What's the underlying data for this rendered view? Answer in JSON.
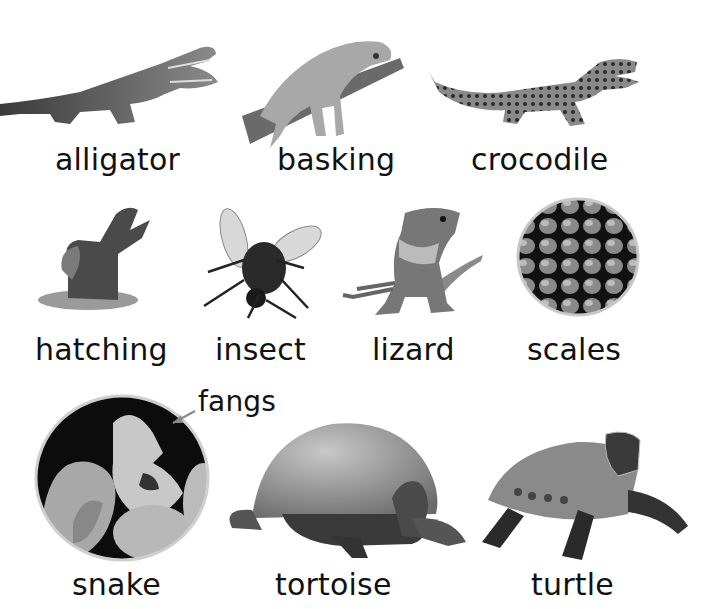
{
  "glossary": {
    "rows": [
      [
        {
          "word": "alligator",
          "image": "alligator-photo"
        },
        {
          "word": "basking",
          "image": "iguana-on-branch-photo"
        },
        {
          "word": "crocodile",
          "image": "crocodile-photo"
        }
      ],
      [
        {
          "word": "hatching",
          "image": "hatching-crocodile-photo"
        },
        {
          "word": "insect",
          "image": "fly-photo"
        },
        {
          "word": "lizard",
          "image": "water-dragon-lizard-photo"
        },
        {
          "word": "scales",
          "image": "scales-closeup-circle-photo"
        }
      ],
      [
        {
          "word": "snake",
          "image": "snake-closeup-circle-photo",
          "callout": "fangs"
        },
        {
          "word": "tortoise",
          "image": "giant-tortoise-photo"
        },
        {
          "word": "turtle",
          "image": "turtle-photo"
        }
      ]
    ]
  },
  "colors": {
    "background": "#ffffff",
    "text": "#111111"
  }
}
